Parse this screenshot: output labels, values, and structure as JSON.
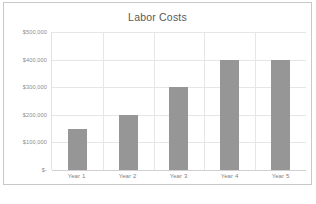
{
  "chart_data": {
    "type": "bar",
    "title": "Labor Costs",
    "xlabel": "",
    "ylabel": "",
    "categories": [
      "Year 1",
      "Year 2",
      "Year 3",
      "Year 4",
      "Year 5"
    ],
    "values": [
      150000,
      200000,
      300000,
      400000,
      400000
    ],
    "ylim": [
      0,
      500000
    ],
    "ytick_values": [
      500000,
      400000,
      300000,
      200000,
      100000,
      0
    ],
    "ytick_labels": [
      "$500,000",
      "$400,000",
      "$300,000",
      "$200,000",
      "$100,000",
      "$-"
    ],
    "grid": true,
    "legend": false,
    "series_color": "#969696"
  },
  "caption": {
    "text": ""
  }
}
